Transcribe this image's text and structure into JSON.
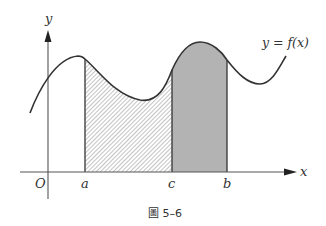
{
  "figure": {
    "caption": "圖 5–6",
    "axes": {
      "x_label": "x",
      "y_label": "y",
      "origin_label": "O"
    },
    "curve_label": "y = f(x)",
    "points": [
      {
        "id": "a",
        "label": "a"
      },
      {
        "id": "c",
        "label": "c"
      },
      {
        "id": "b",
        "label": "b"
      }
    ],
    "regions": [
      {
        "id": "a-to-c",
        "from": "a",
        "to": "c",
        "fill": "hatched"
      },
      {
        "id": "c-to-b",
        "from": "c",
        "to": "b",
        "fill": "solid-gray"
      }
    ],
    "colors": {
      "line": "#333333",
      "solid_fill": "#b3b3b3",
      "hatch": "#9a9a9a",
      "background": "#ffffff"
    }
  }
}
